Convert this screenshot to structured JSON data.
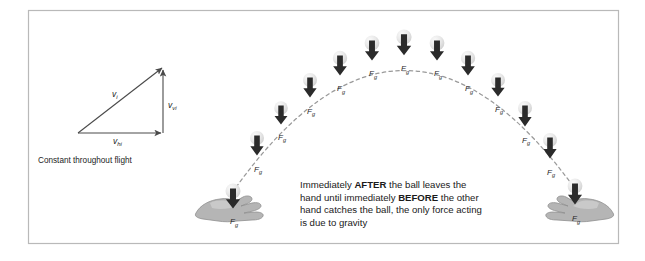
{
  "figure": {
    "background_color": "#ffffff",
    "frame_color": "#b9b9b9",
    "trajectory_color": "#9a9a9a",
    "arrow_color": "#2b2b2b",
    "ball_color": "#e2e2e2",
    "hand_color": "#b5b5b5"
  },
  "vector_diagram": {
    "name": "initial-velocity-vector-triangle",
    "resultant_label": "v",
    "resultant_sub": "i",
    "vertical_label": "v",
    "vertical_sub": "vi",
    "horizontal_label": "v",
    "horizontal_sub": "hi",
    "caption": "Constant throughout flight"
  },
  "explanation": {
    "name": "gravity-explanation-text",
    "lines": [
      [
        {
          "text": "Immediately ",
          "bold": false
        },
        {
          "text": "AFTER",
          "bold": true
        },
        {
          "text": " the ball leaves the",
          "bold": false
        }
      ],
      [
        {
          "text": "hand until immediately ",
          "bold": false
        },
        {
          "text": "BEFORE",
          "bold": true
        },
        {
          "text": " the other",
          "bold": false
        }
      ],
      [
        {
          "text": "hand catches the ball, the only force acting",
          "bold": false
        }
      ],
      [
        {
          "text": "is due to gravity",
          "bold": false
        }
      ]
    ],
    "plain_text": "Immediately AFTER the ball leaves the hand until immediately BEFORE the other hand catches the ball, the only force acting is due to gravity"
  },
  "force_label": {
    "symbol": "F",
    "subscript": "g",
    "meaning": "force due to gravity"
  },
  "hands": [
    {
      "name": "throwing-hand-left",
      "side": "left",
      "x": 232,
      "y": 199,
      "flip": false
    },
    {
      "name": "catching-hand-right",
      "side": "right",
      "x": 578,
      "y": 199,
      "flip": true
    }
  ],
  "trajectory": {
    "type": "parabolic-arc",
    "start": {
      "x": 232,
      "y": 193
    },
    "apex": {
      "x": 404,
      "y": 37
    },
    "end": {
      "x": 578,
      "y": 193
    },
    "dash_pattern": "3.4 3.4"
  },
  "balls": [
    {
      "index": 1,
      "x": 233,
      "y": 191,
      "r": 7.5,
      "arrow_len": 20,
      "label_dy": 16
    },
    {
      "index": 2,
      "x": 257,
      "y": 138,
      "r": 7.0,
      "arrow_len": 20,
      "label_dy": 16
    },
    {
      "index": 3,
      "x": 281,
      "y": 108,
      "r": 6.8,
      "arrow_len": 19,
      "label_dy": 15
    },
    {
      "index": 4,
      "x": 310,
      "y": 80,
      "r": 7.0,
      "arrow_len": 20,
      "label_dy": 16
    },
    {
      "index": 5,
      "x": 340,
      "y": 58,
      "r": 7.2,
      "arrow_len": 20,
      "label_dy": 16
    },
    {
      "index": 6,
      "x": 372,
      "y": 43,
      "r": 7.4,
      "arrow_len": 20,
      "label_dy": 16
    },
    {
      "index": 7,
      "x": 404,
      "y": 37,
      "r": 7.6,
      "arrow_len": 21,
      "label_dy": 16
    },
    {
      "index": 8,
      "x": 437,
      "y": 43,
      "r": 7.4,
      "arrow_len": 20,
      "label_dy": 16
    },
    {
      "index": 9,
      "x": 468,
      "y": 58,
      "r": 7.2,
      "arrow_len": 20,
      "label_dy": 16
    },
    {
      "index": 10,
      "x": 498,
      "y": 80,
      "r": 7.0,
      "arrow_len": 19,
      "label_dy": 15
    },
    {
      "index": 11,
      "x": 525,
      "y": 108,
      "r": 7.0,
      "arrow_len": 21,
      "label_dy": 16
    },
    {
      "index": 12,
      "x": 550,
      "y": 140,
      "r": 7.0,
      "arrow_len": 21,
      "label_dy": 16
    },
    {
      "index": 13,
      "x": 575,
      "y": 186,
      "r": 7.4,
      "arrow_len": 21,
      "label_dy": 17
    }
  ]
}
